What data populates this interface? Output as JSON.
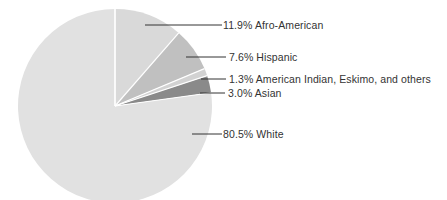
{
  "chart_data": {
    "type": "pie",
    "title": "",
    "start_angle_deg": 0,
    "direction": "clockwise",
    "center": [
      115,
      106
    ],
    "radius": 97,
    "slices": [
      {
        "label": "Afro-American",
        "value": 11.9,
        "display": "11.9% Afro-American",
        "color": "#d9d9d9",
        "leader": {
          "x1": 145,
          "x2": 222,
          "y": 25
        },
        "text_pos": [
          223,
          19
        ]
      },
      {
        "label": "Hispanic",
        "value": 7.6,
        "display": "7.6% Hispanic",
        "color": "#c0c0c0",
        "leader": {
          "x1": 186,
          "x2": 226,
          "y": 57
        },
        "text_pos": [
          229,
          51
        ]
      },
      {
        "label": "American Indian, Eskimo, and others",
        "value": 1.3,
        "display": "1.3% American Indian, Eskimo, and others",
        "color": "#d2d2d2",
        "leader": {
          "x1": 201,
          "x2": 226,
          "y": 79
        },
        "text_pos": [
          229,
          73
        ]
      },
      {
        "label": "Asian",
        "value": 3.0,
        "display": "3.0% Asian",
        "color": "#8a8a8a",
        "leader": {
          "x1": 200,
          "x2": 225,
          "y": 93
        },
        "text_pos": [
          228,
          87
        ]
      },
      {
        "label": "White",
        "value": 80.5,
        "display": "80.5% White",
        "color": "#e1e1e1",
        "leader": {
          "x1": 192,
          "x2": 222,
          "y": 134
        },
        "text_pos": [
          223,
          128
        ]
      }
    ],
    "separator_color": "#ffffff",
    "leader_color": "#333333",
    "legend": "leader-line labels to the right"
  }
}
